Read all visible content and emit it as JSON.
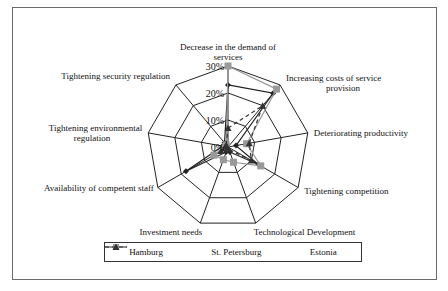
{
  "chart_data": {
    "type": "radar",
    "title": "",
    "categories": [
      "Decrease in the demand of services",
      "Increasing costs of service provision",
      "Deteriorating productivity",
      "Tightening competition",
      "Technological Development",
      "Investment needs",
      "Availability of competent staff",
      "Tightening environmental regulation",
      "Tightening security regulation"
    ],
    "axis_label_lines": [
      [
        "Decrease in the demand of",
        "services"
      ],
      [
        "Increasing costs of service",
        "provision"
      ],
      [
        "Deteriorating productivity"
      ],
      [
        "Tightening competition"
      ],
      [
        "Technological Development"
      ],
      [
        "Investment needs"
      ],
      [
        "Availability of competent staff"
      ],
      [
        "Tightening environmental",
        "regulation"
      ],
      [
        "Tightening security regulation"
      ]
    ],
    "ticks": [
      "0%",
      "10%",
      "20%",
      "30%"
    ],
    "tick_values": [
      0,
      10,
      20,
      30
    ],
    "rmax": 30,
    "grid": true,
    "legend_position": "bottom",
    "series": [
      {
        "name": "Hamburg",
        "marker": "diamond",
        "line": "solid",
        "color": "#222222",
        "values": [
          23,
          26,
          3,
          13,
          2,
          2,
          18,
          2,
          2
        ]
      },
      {
        "name": "St. Petersburg",
        "marker": "square",
        "line": "solid",
        "color": "#999999",
        "values": [
          30,
          28,
          7,
          14,
          6,
          5,
          6,
          1,
          1
        ]
      },
      {
        "name": "Estonia",
        "marker": "triangle",
        "line": "dashed",
        "color": "#333333",
        "values": [
          7,
          20,
          8,
          10,
          1,
          1,
          3,
          1,
          1
        ]
      }
    ]
  },
  "legend": {
    "items": [
      "Hamburg",
      "St. Petersburg",
      "Estonia"
    ]
  }
}
